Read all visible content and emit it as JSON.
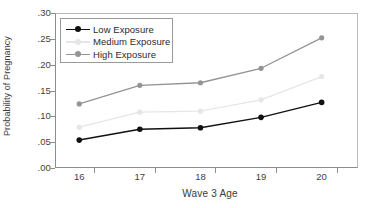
{
  "chart_data": {
    "type": "line",
    "title": "",
    "xlabel": "Wave 3 Age",
    "ylabel": "Probability of Pregnancy",
    "categories": [
      "16",
      "17",
      "18",
      "19",
      "20"
    ],
    "x": [
      16,
      17,
      18,
      19,
      20
    ],
    "xlim": [
      15.6,
      20.6
    ],
    "ylim": [
      0.0,
      0.3
    ],
    "grid": false,
    "legend_position": "top-left",
    "y_ticks": [
      0.0,
      0.05,
      0.1,
      0.15,
      0.2,
      0.25,
      0.3
    ],
    "y_tick_labels": [
      ".00",
      ".05",
      ".10",
      ".15",
      ".20",
      ".25",
      ".30"
    ],
    "x_tick_labels": [
      "16",
      "17",
      "18",
      "19",
      "20"
    ],
    "series": [
      {
        "name": "Low Exposure",
        "color": "#111111",
        "values": [
          0.054,
          0.075,
          0.078,
          0.098,
          0.127
        ]
      },
      {
        "name": "Medium Exposure",
        "color": "#e6e6e6",
        "values": [
          0.079,
          0.108,
          0.11,
          0.132,
          0.177
        ]
      },
      {
        "name": "High Exposure",
        "color": "#949494",
        "values": [
          0.124,
          0.16,
          0.165,
          0.193,
          0.252
        ]
      }
    ]
  },
  "axes": {
    "y_title": "Probability of Pregnancy",
    "x_title": "Wave 3 Age"
  },
  "legend": {
    "items": [
      {
        "label": "Low Exposure"
      },
      {
        "label": "Medium Exposure"
      },
      {
        "label": "High Exposure"
      }
    ]
  }
}
